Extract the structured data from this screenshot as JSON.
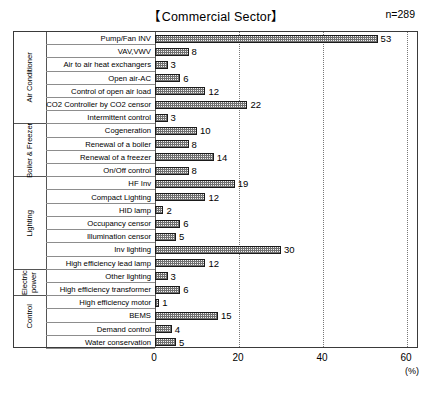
{
  "chart_data": {
    "type": "bar",
    "orientation": "horizontal",
    "title": "【Commercial Sector】",
    "sample_size": "n=289",
    "xlabel": "(%)",
    "ylabel": "",
    "xlim": [
      0,
      60
    ],
    "xticks": [
      0,
      20,
      40,
      60
    ],
    "grid": true,
    "legend": "none",
    "categories": [
      "Pump/Fan INV",
      "VAV,VWV",
      "Air to air heat exchangers",
      "Open air-AC",
      "Control of open air load",
      "CO2 Controller by CO2 censor",
      "Intermittent control",
      "Cogeneration",
      "Renewal of a boiler",
      "Renewal of a freezer",
      "On/Off control",
      "HF Inv",
      "Compact Lighting",
      "HID lamp",
      "Occupancy censor",
      "Illumination censor",
      "Inv lighting",
      "High efficiency lead lamp",
      "Other lighting",
      "High efficiency transformer",
      "High efficiency motor",
      "BEMS",
      "Demand control",
      "Water conservation"
    ],
    "values": [
      53,
      8,
      3,
      6,
      12,
      22,
      3,
      10,
      8,
      14,
      8,
      19,
      12,
      2,
      6,
      5,
      30,
      12,
      3,
      6,
      1,
      15,
      4,
      5
    ],
    "groups": [
      {
        "label": "Air Conditioner",
        "count": 7
      },
      {
        "label": "Boiler & Freezer",
        "count": 4
      },
      {
        "label": "Lighting",
        "count": 7
      },
      {
        "label": "Electric power",
        "count": 2
      },
      {
        "label": "Control",
        "count": 3
      }
    ]
  }
}
